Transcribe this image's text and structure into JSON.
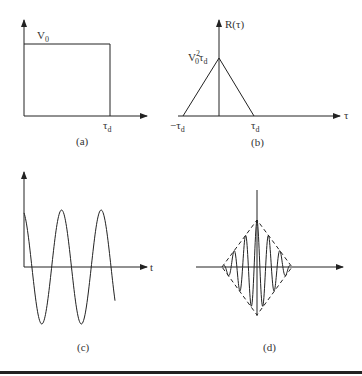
{
  "panels": {
    "a": {
      "caption": "(a)",
      "y_label": "V",
      "y_label_sub": "0",
      "x_tick": "τ",
      "x_tick_sub": "d",
      "description": "Rectangular pulse of height V0 from 0 to τd"
    },
    "b": {
      "caption": "(b)",
      "y_label": "R(τ)",
      "peak_label": "V",
      "peak_label_sub": "0",
      "peak_label_sup": "2",
      "peak_label_tail": "τ",
      "peak_label_tail_sub": "d",
      "x_tick_left": "−τ",
      "x_tick_left_sub": "d",
      "x_tick_right": "τ",
      "x_tick_right_sub": "d",
      "x_label": "τ",
      "description": "Triangular autocorrelation with peak V0²τd spanning −τd to τd"
    },
    "c": {
      "caption": "(c)",
      "x_label": "t",
      "description": "Truncated cosine waveform"
    },
    "d": {
      "caption": "(d)",
      "description": "Oscillating autocorrelation within dashed triangular envelope"
    }
  },
  "chart_data": [
    {
      "type": "line",
      "title": "(a)",
      "x": [
        0,
        0,
        1,
        1
      ],
      "y": [
        0,
        1,
        1,
        0
      ],
      "xlabel": "",
      "ylabel": "V0",
      "ticks": [
        "τd"
      ]
    },
    {
      "type": "line",
      "title": "(b)",
      "x": [
        -1,
        0,
        1
      ],
      "y": [
        0,
        1,
        0
      ],
      "xlabel": "τ",
      "ylabel": "R(τ)",
      "ticks": [
        "−τd",
        "τd"
      ],
      "annotations": [
        "V0²τd"
      ]
    },
    {
      "type": "line",
      "title": "(c)",
      "description": "cosine, ~2.25 cycles",
      "xlabel": "t"
    },
    {
      "type": "line",
      "title": "(d)",
      "description": "cosine modulated by triangular envelope (dashed)"
    }
  ]
}
